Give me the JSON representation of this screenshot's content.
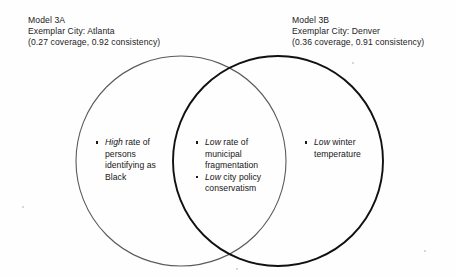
{
  "figure": {
    "type": "venn-diagram",
    "background_color": "#fefefe",
    "sets": 2
  },
  "labels": {
    "left": {
      "model": "Model 3A",
      "exemplar": "Exemplar City: Atlanta",
      "metrics": "(0.27 coverage, 0.92 consistency)"
    },
    "right": {
      "model": "Model 3B",
      "exemplar": "Exemplar City: Denver",
      "metrics": "(0.36 coverage, 0.91 consistency)"
    }
  },
  "regions": {
    "left_only": {
      "items": [
        {
          "emphasis": "High",
          "rest": " rate of persons identifying as Black"
        }
      ]
    },
    "intersection": {
      "items": [
        {
          "emphasis": "Low",
          "rest": " rate of municipal fragmentation"
        },
        {
          "emphasis": "Low",
          "rest": " city policy conservatism"
        }
      ]
    },
    "right_only": {
      "items": [
        {
          "emphasis": "Low",
          "rest": " winter temperature"
        }
      ]
    }
  },
  "geometry": {
    "left_circle": {
      "cx": 181,
      "cy": 161,
      "r": 105,
      "stroke": "#5a5a5a",
      "stroke_width": 1.1
    },
    "right_circle": {
      "cx": 278,
      "cy": 161,
      "r": 105,
      "stroke": "#111111",
      "stroke_width": 1.9
    }
  }
}
